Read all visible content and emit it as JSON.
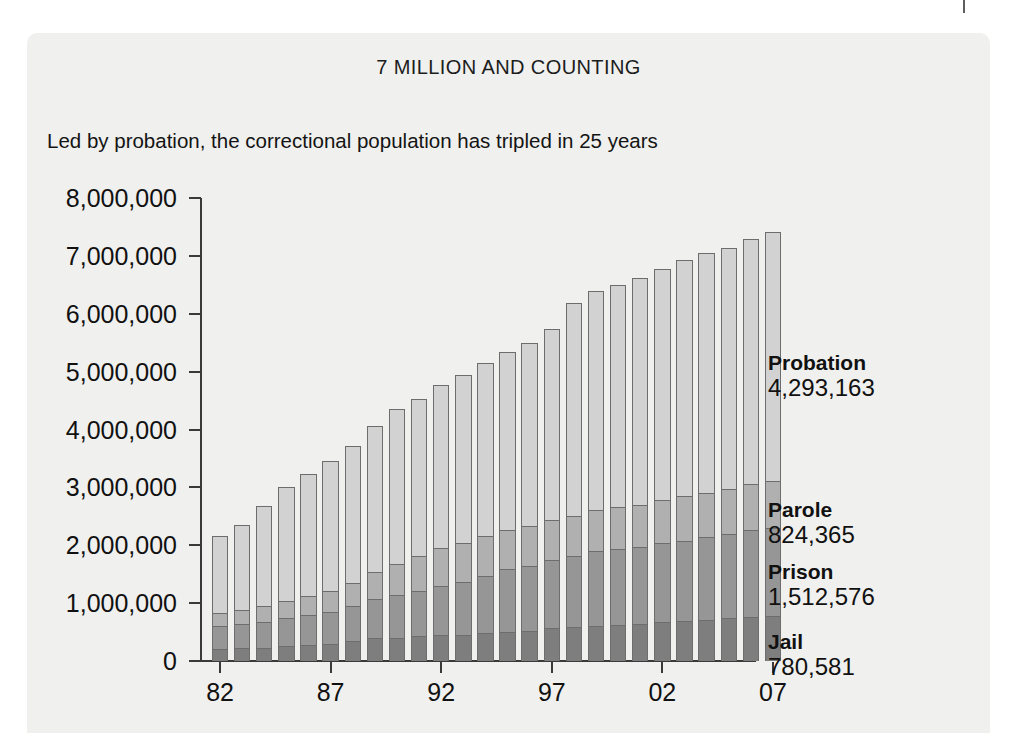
{
  "chart_data": {
    "type": "bar",
    "subtype": "stacked-vertical",
    "title": "7 MILLION AND COUNTING",
    "subtitle": "Led by probation, the correctional population has tripled in 25 years",
    "xlabel": "",
    "ylabel": "",
    "ylim": [
      0,
      8000000
    ],
    "ytick_labels": [
      "8,000,000",
      "7,000,000",
      "6,000,000",
      "5,000,000",
      "4,000,000",
      "3,000,000",
      "2,000,000",
      "1,000,000",
      "0"
    ],
    "ytick_values": [
      8000000,
      7000000,
      6000000,
      5000000,
      4000000,
      3000000,
      2000000,
      1000000,
      0
    ],
    "grid": false,
    "legend_position": "right",
    "categories": [
      "82",
      "83",
      "84",
      "85",
      "86",
      "87",
      "88",
      "89",
      "90",
      "91",
      "92",
      "93",
      "94",
      "95",
      "96",
      "97",
      "98",
      "99",
      "00",
      "01",
      "02",
      "03",
      "04",
      "05",
      "06",
      "07"
    ],
    "xtick_labels": [
      "82",
      "87",
      "92",
      "97",
      "02",
      "07"
    ],
    "xtick_category_index": [
      0,
      5,
      10,
      15,
      20,
      25
    ],
    "stack_order_bottom_to_top": [
      "Jail",
      "Prison",
      "Parole",
      "Probation"
    ],
    "series": [
      {
        "name": "Jail",
        "color": "#7e7e7e",
        "values": [
          207853,
          221815,
          233018,
          256615,
          274444,
          294092,
          341893,
          393303,
          403019,
          424129,
          441781,
          455500,
          479800,
          507044,
          518492,
          567079,
          592462,
          605943,
          621149,
          631240,
          665475,
          691301,
          713990,
          747529,
          765819,
          780581
        ]
      },
      {
        "name": "Prison",
        "color": "#969696",
        "values": [
          395516,
          419346,
          443398,
          480568,
          522084,
          560812,
          603732,
          680907,
          743382,
          792535,
          850566,
          909381,
          990147,
          1078542,
          1127528,
          1176564,
          1224469,
          1287172,
          1316333,
          1330007,
          1367856,
          1390279,
          1421345,
          1448344,
          1492973,
          1512576
        ]
      },
      {
        "name": "Parole",
        "color": "#b0b0b0",
        "values": [
          224604,
          246440,
          266992,
          300203,
          325638,
          355505,
          407977,
          456803,
          531407,
          590442,
          658601,
          676100,
          690371,
          679421,
          679733,
          694787,
          696385,
          714457,
          725527,
          732333,
          750934,
          773500,
          771852,
          784408,
          799058,
          824365
        ]
      },
      {
        "name": "Probation",
        "color": "#d2d2d2",
        "values": [
          1335359,
          1468245,
          1740948,
          1968712,
          2114621,
          2247158,
          2356483,
          2522125,
          2670234,
          2728472,
          2811611,
          2903061,
          2981022,
          3077861,
          3164996,
          3296513,
          3670441,
          3779922,
          3826209,
          3931731,
          3995165,
          4073987,
          4151125,
          4162536,
          4236800,
          4293163
        ]
      }
    ],
    "totals": [
      2163332,
      2355846,
      2684356,
      3006098,
      3236787,
      3457567,
      3710085,
      4053138,
      4348042,
      4535578,
      4762559,
      4944042,
      5141340,
      5342868,
      5490749,
      5734943,
      6183757,
      6387494,
      6489218,
      6625311,
      6779430,
      6929067,
      7058312,
      7142817,
      7294650,
      7410685
    ]
  },
  "legend": {
    "entries": [
      {
        "name": "Probation",
        "value": "4,293,163"
      },
      {
        "name": "Parole",
        "value": "824,365"
      },
      {
        "name": "Prison",
        "value": "1,512,576"
      },
      {
        "name": "Jail",
        "value": "780,581"
      }
    ]
  },
  "theme": {
    "panel_bg": "#f0f0ee",
    "page_bg": "#ffffff",
    "axis_color": "#3a3a3a",
    "text_color": "#111111"
  }
}
